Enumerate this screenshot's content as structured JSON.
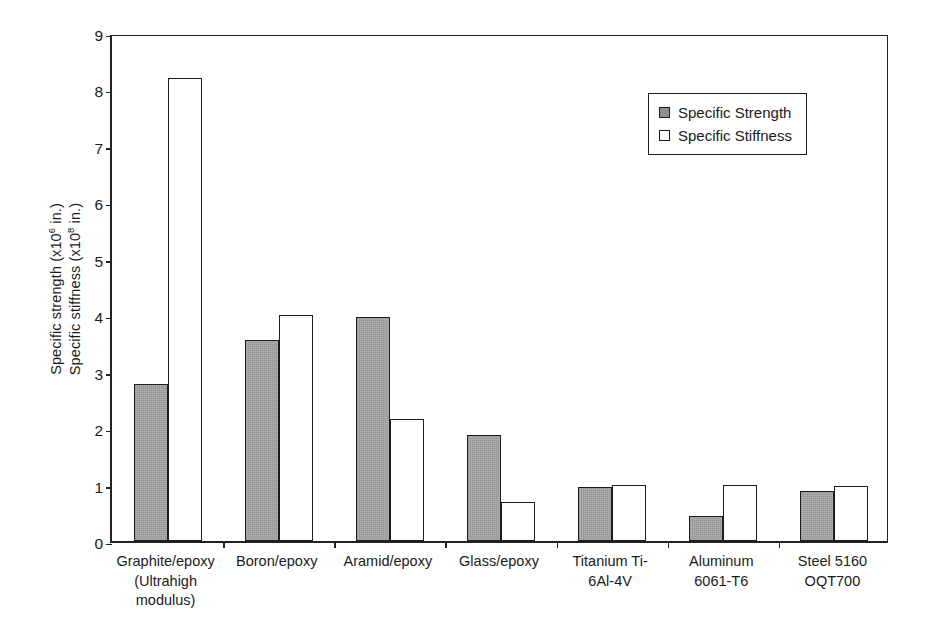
{
  "chart_data": {
    "type": "bar",
    "title": "",
    "xlabel": "",
    "ylabel_lines": [
      {
        "pre": "Specific strength (x10",
        "exp": "6",
        "post": " in.)"
      },
      {
        "pre": "Specific stiffness (x10",
        "exp": "8",
        "post": " in.)"
      }
    ],
    "ylim": [
      0,
      9
    ],
    "yticks": [
      9,
      8,
      7,
      6,
      5,
      4,
      3,
      2,
      1,
      0
    ],
    "grid": false,
    "legend_position": "upper right",
    "categories": [
      [
        "Graphite/epoxy",
        "(Ultrahigh",
        "modulus)"
      ],
      [
        "Boron/epoxy"
      ],
      [
        "Aramid/epoxy"
      ],
      [
        "Glass/epoxy"
      ],
      [
        "Titanium Ti-",
        "6Al-4V"
      ],
      [
        "Aluminum",
        "6061-T6"
      ],
      [
        "Steel 5160",
        "OQT700"
      ]
    ],
    "series": [
      {
        "name": "Specific Strength",
        "color": "#9c9c9c",
        "values": [
          2.78,
          3.57,
          3.97,
          1.88,
          0.95,
          0.45,
          0.88
        ]
      },
      {
        "name": "Specific Stiffness",
        "color": "#ffffff",
        "values": [
          8.2,
          4.0,
          2.17,
          0.7,
          1.0,
          0.99,
          0.97
        ]
      }
    ]
  },
  "legend": {
    "items": [
      {
        "label": "Specific Strength",
        "swatch": "filled-gray-swatch"
      },
      {
        "label": "Specific Stiffness",
        "swatch": "hollow-white-swatch"
      }
    ]
  },
  "axis": {
    "y_tick_labels": [
      "9",
      "8",
      "7",
      "6",
      "5",
      "4",
      "3",
      "2",
      "1",
      "0"
    ]
  }
}
